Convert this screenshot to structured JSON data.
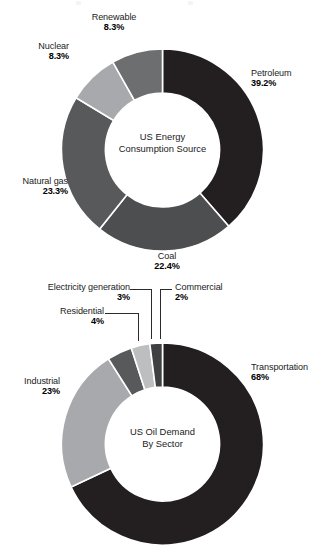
{
  "page": {
    "background_color": "#ffffff",
    "width": 325,
    "height": 554
  },
  "palette": {
    "near_black": "#231f20",
    "dark_gray": "#3f4042",
    "mid_dark_gray": "#4d4e50",
    "mid_gray": "#58595b",
    "gray": "#6d6e70",
    "light_gray": "#a7a9ac",
    "lighter_gray": "#bcbec0",
    "separator": "#ffffff",
    "label_text": "#1b1b1b",
    "value_text": "#000000",
    "leader_line": "#2b2b2b"
  },
  "charts": [
    {
      "id": "us-energy-consumption-source",
      "center_caption": [
        "US Energy",
        "Consumption Source"
      ],
      "labels": [
        {
          "name": "Petroleum",
          "value": "39.2%"
        },
        {
          "name": "Coal",
          "value": "22.4%"
        },
        {
          "name": "Natural gas",
          "value": "23.3%"
        },
        {
          "name": "Nuclear",
          "value": "8.3%"
        },
        {
          "name": "Renewable",
          "value": "8.3%"
        }
      ]
    },
    {
      "id": "us-oil-demand-by-sector",
      "center_caption": [
        "US Oil Demand",
        "By Sector"
      ],
      "labels": [
        {
          "name": "Transportation",
          "value": "68%"
        },
        {
          "name": "Industrial",
          "value": "23%"
        },
        {
          "name": "Residential",
          "value": "4%"
        },
        {
          "name": "Electricity generation",
          "value": "3%"
        },
        {
          "name": "Commercial",
          "value": "2%"
        }
      ]
    }
  ],
  "chart_data": [
    {
      "type": "pie",
      "variant": "donut",
      "title": "US Energy Consumption Source",
      "center_label": "US Energy Consumption Source",
      "xlabel": "",
      "ylabel": "",
      "units": "percent",
      "legend": "none (direct labels around donut)",
      "start_angle_deg": 0,
      "direction": "clockwise",
      "inner_radius_ratio": 0.565,
      "categories": [
        "Petroleum",
        "Coal",
        "Natural gas",
        "Nuclear",
        "Renewable"
      ],
      "values": [
        39.2,
        22.4,
        23.3,
        8.3,
        8.3
      ],
      "value_labels": [
        "39.2%",
        "22.4%",
        "23.3%",
        "8.3%",
        "8.3%"
      ],
      "colors": [
        "#231f20",
        "#4d4e50",
        "#58595b",
        "#a7a9ac",
        "#6d6e70"
      ],
      "total": 101.5
    },
    {
      "type": "pie",
      "variant": "donut",
      "title": "US Oil Demand By Sector",
      "center_label": "US Oil Demand By Sector",
      "xlabel": "",
      "ylabel": "",
      "units": "percent",
      "legend": "none (direct labels around donut)",
      "start_angle_deg": 0,
      "direction": "clockwise",
      "inner_radius_ratio": 0.565,
      "categories": [
        "Transportation",
        "Industrial",
        "Residential",
        "Electricity generation",
        "Commercial"
      ],
      "values": [
        68,
        23,
        4,
        3,
        2
      ],
      "value_labels": [
        "68%",
        "23%",
        "4%",
        "3%",
        "2%"
      ],
      "colors": [
        "#231f20",
        "#a7a9ac",
        "#58595b",
        "#bcbec0",
        "#3f4042"
      ],
      "total": 100
    }
  ]
}
